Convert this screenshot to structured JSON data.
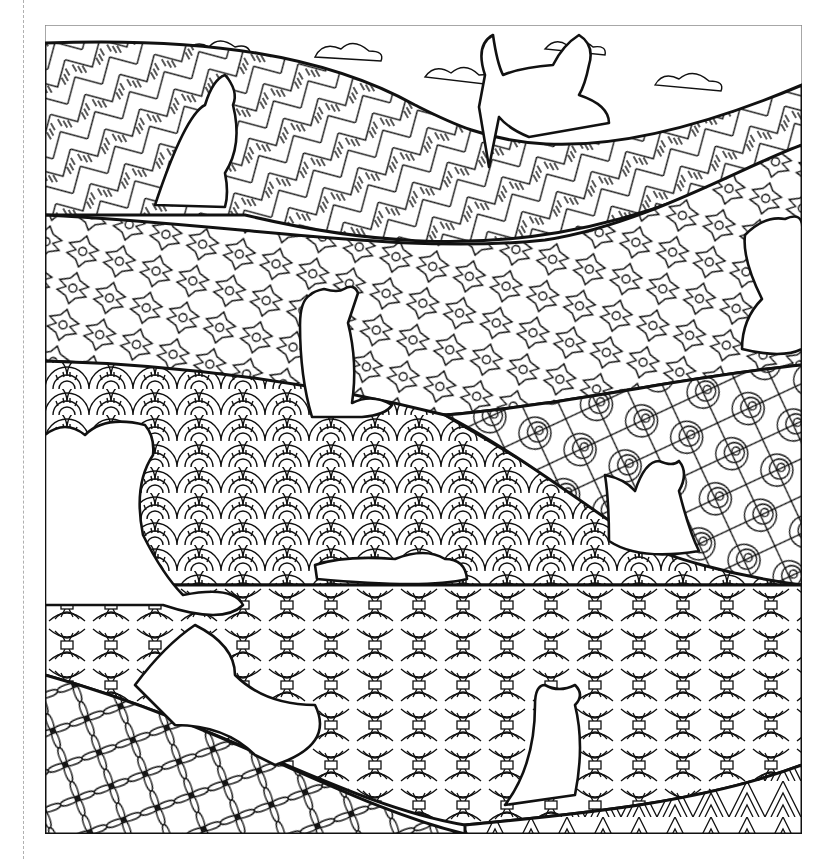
{
  "image": {
    "kind": "coloring-page",
    "description": "Line-art coloring page of cat silhouettes sitting on rolling hills filled with zentangle patterns under a cloudy sky",
    "stroke_color": "#111111",
    "background_color": "#ffffff",
    "frame_color": "#8a8a8a",
    "cut_line_color": "#b0b0b0"
  },
  "scene": {
    "sky": {
      "pattern": "clouds",
      "cloud_count": 14
    },
    "bands": [
      {
        "name": "herringbone-hill",
        "pattern": "herringbone-stripes"
      },
      {
        "name": "quatrefoil-hill",
        "pattern": "quatrefoil-dots"
      },
      {
        "name": "rainbow-arc-hill",
        "pattern": "scallop-arcs"
      },
      {
        "name": "swirl-hill",
        "pattern": "swirls-web"
      },
      {
        "name": "wheatsheaf-hill",
        "pattern": "wheat-bundles"
      },
      {
        "name": "lattice-hill",
        "pattern": "diamond-lattice"
      },
      {
        "name": "chevron-hill",
        "pattern": "chevron-stripes"
      }
    ],
    "cats": [
      {
        "id": "cat-sky-large",
        "pose": "sitting-back-view"
      },
      {
        "id": "cat-top-left",
        "pose": "sitting-back-view"
      },
      {
        "id": "cat-center",
        "pose": "sitting-back-view"
      },
      {
        "id": "cat-right-edge",
        "pose": "reaching-up"
      },
      {
        "id": "cat-left-edge",
        "pose": "reaching-up"
      },
      {
        "id": "cat-right-middle",
        "pose": "sitting-tail-up"
      },
      {
        "id": "cat-lying",
        "pose": "lying-down"
      },
      {
        "id": "cat-stretching",
        "pose": "stretching"
      },
      {
        "id": "cat-bottom",
        "pose": "sitting-back-view"
      }
    ]
  }
}
